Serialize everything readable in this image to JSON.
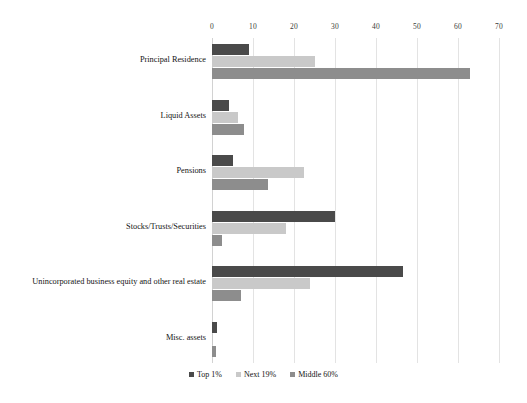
{
  "chart_data": {
    "type": "bar",
    "orientation": "horizontal",
    "title": "",
    "subtitle": "",
    "xlabel": "",
    "ylabel": "",
    "xlim": [
      0,
      70
    ],
    "xticks": [
      0,
      10,
      20,
      30,
      40,
      50,
      60,
      70
    ],
    "xtick_labels": [
      "0",
      "10",
      "20",
      "30",
      "40",
      "50",
      "60",
      "70"
    ],
    "grid": true,
    "legend_position": "bottom",
    "categories": [
      "Principal Residence",
      "Liquid Assets",
      "Pensions",
      "Stocks/Trusts/Securities",
      "Unincorporated business equity and other real estate",
      "Misc. assets"
    ],
    "series": [
      {
        "name": "Top 1%",
        "color": "#4a4a4a",
        "values": [
          9,
          4.1,
          5,
          30,
          46.5,
          1.3
        ]
      },
      {
        "name": "Next 19%",
        "color": "#c9c9c9",
        "values": [
          25,
          6.3,
          22.5,
          18,
          24,
          0.3
        ]
      },
      {
        "name": "Middle 60%",
        "color": "#8d8d8d",
        "values": [
          63,
          7.8,
          13.7,
          2.5,
          7,
          1.0
        ]
      }
    ]
  },
  "legend": {
    "items": [
      {
        "label": "Top 1%",
        "color": "#4a4a4a"
      },
      {
        "label": "Next 19%",
        "color": "#c9c9c9"
      },
      {
        "label": "Middle 60%",
        "color": "#8d8d8d"
      }
    ]
  },
  "axis": {
    "ticks": [
      "0",
      "10",
      "20",
      "30",
      "40",
      "50",
      "60",
      "70"
    ]
  }
}
